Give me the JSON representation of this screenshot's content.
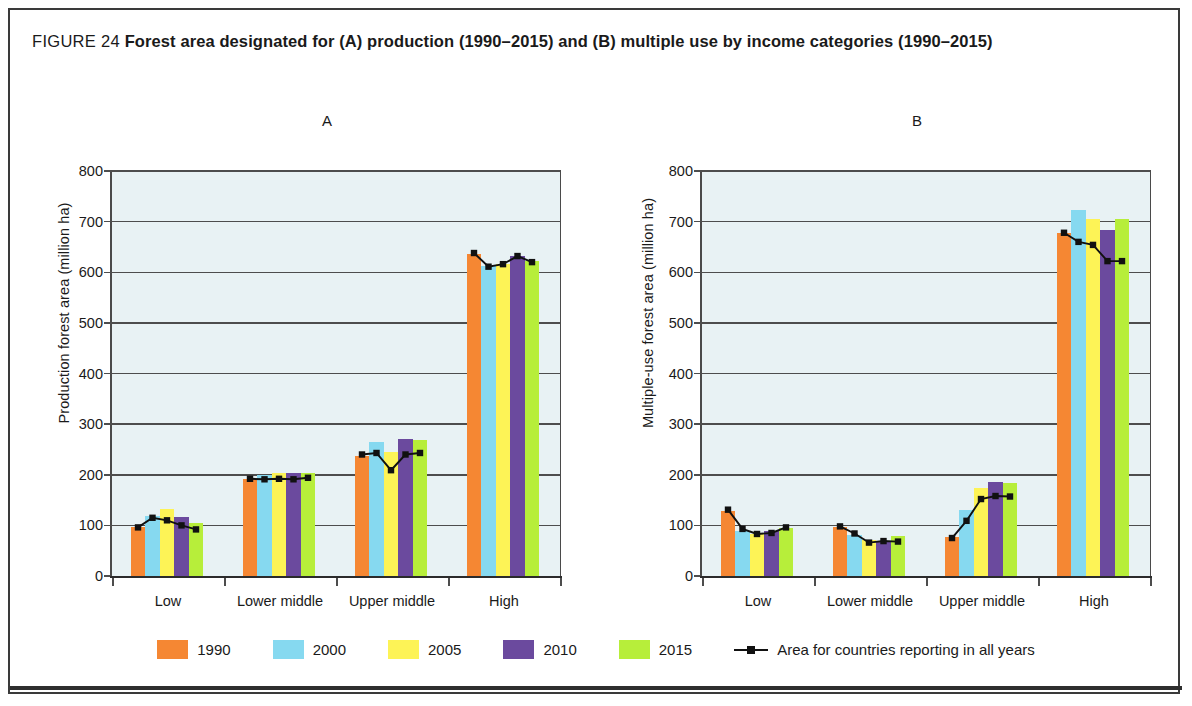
{
  "figure": {
    "label": "FIGURE 24",
    "title": "Forest area designated for (A) production (1990–2015) and (B) multiple use by income categories (1990–2015)"
  },
  "legend": {
    "items": [
      {
        "label": "1990",
        "color": "#f58733"
      },
      {
        "label": "2000",
        "color": "#86d9f0"
      },
      {
        "label": "2005",
        "color": "#fdf356"
      },
      {
        "label": "2010",
        "color": "#6b4a9e"
      },
      {
        "label": "2015",
        "color": "#b7ee3a"
      }
    ],
    "line_label": "Area for countries reporting in all years",
    "line_color": "#111111"
  },
  "chart_data": [
    {
      "type": "bar",
      "panel": "A",
      "title": "A",
      "xlabel": "",
      "ylabel": "Production forest area (million ha)",
      "ylim": [
        0,
        800
      ],
      "yticks": [
        0,
        100,
        200,
        300,
        400,
        500,
        600,
        700,
        800
      ],
      "grid": true,
      "legend_position": "bottom",
      "categories": [
        "Low",
        "Lower middle",
        "Upper middle",
        "High"
      ],
      "series": [
        {
          "name": "1990",
          "color": "#f58733",
          "values": [
            97,
            192,
            237,
            637
          ]
        },
        {
          "name": "2000",
          "color": "#86d9f0",
          "values": [
            119,
            200,
            265,
            612
          ]
        },
        {
          "name": "2005",
          "color": "#fdf356",
          "values": [
            132,
            203,
            245,
            617
          ]
        },
        {
          "name": "2010",
          "color": "#6b4a9e",
          "values": [
            117,
            203,
            270,
            633
          ]
        },
        {
          "name": "2015",
          "color": "#b7ee3a",
          "values": [
            104,
            203,
            268,
            622
          ]
        }
      ],
      "line_series": {
        "name": "Area for countries reporting in all years",
        "color": "#111111",
        "values": [
          [
            96,
            115,
            110,
            100,
            92
          ],
          [
            192,
            191,
            192,
            191,
            194
          ],
          [
            240,
            243,
            209,
            240,
            243
          ],
          [
            638,
            611,
            616,
            632,
            620
          ]
        ]
      }
    },
    {
      "type": "bar",
      "panel": "B",
      "title": "B",
      "xlabel": "",
      "ylabel": "Multiple-use forest area (million ha)",
      "ylim": [
        0,
        800
      ],
      "yticks": [
        0,
        100,
        200,
        300,
        400,
        500,
        600,
        700,
        800
      ],
      "grid": true,
      "legend_position": "bottom",
      "categories": [
        "Low",
        "Lower middle",
        "Upper middle",
        "High"
      ],
      "series": [
        {
          "name": "1990",
          "color": "#f58733",
          "values": [
            128,
            97,
            77,
            678
          ]
        },
        {
          "name": "2000",
          "color": "#86d9f0",
          "values": [
            88,
            82,
            130,
            723
          ]
        },
        {
          "name": "2005",
          "color": "#fdf356",
          "values": [
            83,
            72,
            173,
            706
          ]
        },
        {
          "name": "2010",
          "color": "#6b4a9e",
          "values": [
            88,
            70,
            185,
            683
          ]
        },
        {
          "name": "2015",
          "color": "#b7ee3a",
          "values": [
            95,
            80,
            183,
            705
          ]
        }
      ],
      "line_series": {
        "name": "Area for countries reporting in all years",
        "color": "#111111",
        "values": [
          [
            131,
            93,
            83,
            85,
            96
          ],
          [
            98,
            84,
            66,
            69,
            68
          ],
          [
            75,
            109,
            152,
            158,
            157
          ],
          [
            678,
            660,
            654,
            622,
            622
          ]
        ]
      }
    }
  ]
}
